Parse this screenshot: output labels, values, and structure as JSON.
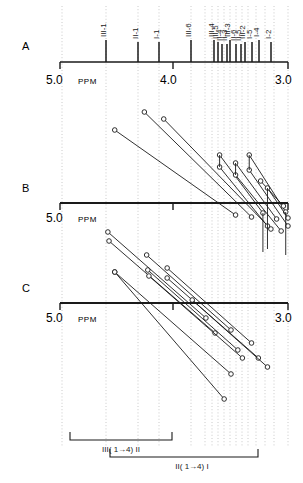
{
  "figure": {
    "type": "nmr-spectrum-correlation-figure",
    "background": "#ffffff",
    "line_color": "#1a1a1a",
    "grid_color": "#bdbdbd",
    "width": 303,
    "height": 483
  },
  "panels": [
    {
      "id": "A",
      "label": "A",
      "label_x": 22,
      "label_y": 46,
      "axis_y": 62
    },
    {
      "id": "B",
      "label": "B",
      "label_x": 22,
      "label_y": 188,
      "axis_y": 203
    },
    {
      "id": "C",
      "label": "C",
      "label_x": 22,
      "label_y": 288,
      "axis_y": 303
    }
  ],
  "axis": {
    "ppm_unit": "PPM",
    "left_label": "5.0",
    "mid_label": "4.0",
    "right_label": "3.0",
    "left_ppm": 5.0,
    "mid_ppm": 4.0,
    "right_ppm": 3.0,
    "x_left_px": 60,
    "x_right_px": 288,
    "ticks_ppm": [
      5.0,
      4.6,
      4.2,
      4.0,
      3.8,
      3.4,
      3.0
    ],
    "tick_label_y_offsets": [
      78,
      78,
      78
    ],
    "label_positions": {
      "left_x": 60,
      "mid_x": 173,
      "right_x": 288
    }
  },
  "chart_data": {
    "type": "scatter",
    "title": "",
    "xlabel": "PPM",
    "ylabel": "",
    "xlim": [
      5.0,
      3.0
    ],
    "grid": true,
    "legend": null,
    "panelA": {
      "description": "1D stick spectrum with assignment labels rotated 90 degrees",
      "peaks": [
        {
          "ppm": 4.52,
          "x_px": 106,
          "label": "III-1",
          "height": 22
        },
        {
          "ppm": 4.24,
          "x_px": 138,
          "label": "II-1",
          "height": 20
        },
        {
          "ppm": 4.06,
          "x_px": 159,
          "label": "I-1",
          "height": 20
        },
        {
          "ppm": 3.78,
          "x_px": 191,
          "label": "III-6",
          "height": 22
        },
        {
          "ppm": 3.58,
          "x_px": 214,
          "label": "III-4",
          "height": 22
        },
        {
          "ppm": 3.55,
          "x_px": 218,
          "label": "III-5",
          "height": 20
        },
        {
          "ppm": 3.52,
          "x_px": 222,
          "label": "II-4",
          "height": 18
        },
        {
          "ppm": 3.48,
          "x_px": 227,
          "label": "II-3",
          "height": 18
        },
        {
          "ppm": 3.45,
          "x_px": 230,
          "label": "III-3",
          "height": 22
        },
        {
          "ppm": 3.4,
          "x_px": 236,
          "label": "II-6",
          "height": 18
        },
        {
          "ppm": 3.36,
          "x_px": 241,
          "label": "II-5",
          "height": 18
        },
        {
          "ppm": 3.32,
          "x_px": 245,
          "label": "III-2",
          "height": 20
        },
        {
          "ppm": 3.26,
          "x_px": 252,
          "label": "I-5",
          "height": 20
        },
        {
          "ppm": 3.2,
          "x_px": 259,
          "label": "I-4",
          "height": 22
        },
        {
          "ppm": 3.1,
          "x_px": 271,
          "label": "I-2",
          "height": 20
        }
      ]
    },
    "panelB": {
      "description": "NOE / correlation connectivity traces, markers are open circles joined by diagonal lines",
      "series": [
        {
          "name": "b1",
          "points": [
            [
              4.52,
              130
            ],
            [
              3.46,
              215
            ]
          ]
        },
        {
          "name": "b2",
          "points": [
            [
              4.26,
              112
            ],
            [
              3.32,
              217
            ]
          ]
        },
        {
          "name": "b3",
          "points": [
            [
              4.09,
              119
            ],
            [
              3.15,
              229
            ]
          ]
        },
        {
          "name": "b4",
          "points": [
            [
              3.6,
              155
            ],
            [
              3.22,
              213
            ]
          ]
        },
        {
          "name": "b5",
          "points": [
            [
              3.6,
              167
            ],
            [
              3.18,
              226
            ]
          ]
        },
        {
          "name": "b6",
          "points": [
            [
              3.46,
              163
            ],
            [
              3.1,
              219
            ]
          ]
        },
        {
          "name": "b7",
          "points": [
            [
              3.46,
              175
            ],
            [
              3.06,
              231
            ]
          ]
        },
        {
          "name": "b8",
          "points": [
            [
              3.34,
              155
            ],
            [
              3.02,
              212
            ]
          ]
        },
        {
          "name": "b9",
          "points": [
            [
              3.34,
              170
            ],
            [
              3.0,
              226
            ]
          ]
        },
        {
          "name": "b10",
          "points": [
            [
              3.24,
              181
            ],
            [
              3.04,
              206
            ]
          ]
        },
        {
          "name": "b11",
          "points": [
            [
              3.18,
              188
            ],
            [
              3.0,
              218
            ]
          ]
        }
      ],
      "vertical_links": [
        {
          "x_ppm": 3.6,
          "y1": 155,
          "y2": 167
        },
        {
          "x_ppm": 3.46,
          "y1": 163,
          "y2": 175
        },
        {
          "x_ppm": 3.34,
          "y1": 155,
          "y2": 170
        },
        {
          "x_ppm": 3.22,
          "y1": 213,
          "y2": 252
        },
        {
          "x_ppm": 3.18,
          "y1": 188,
          "y2": 249
        },
        {
          "x_ppm": 3.02,
          "y1": 212,
          "y2": 255
        }
      ]
    },
    "panelC": {
      "description": "Second correlation panel, longer diagonal traces crossing the baseline",
      "series": [
        {
          "name": "c1",
          "points": [
            [
              4.58,
              232
            ],
            [
              3.72,
              318
            ]
          ]
        },
        {
          "name": "c2",
          "points": [
            [
              4.57,
              241
            ],
            [
              3.64,
              333
            ]
          ]
        },
        {
          "name": "c3",
          "points": [
            [
              4.52,
              272
            ],
            [
              3.5,
              374
            ]
          ]
        },
        {
          "name": "c4",
          "points": [
            [
              4.24,
              255
            ],
            [
              3.5,
              330
            ]
          ]
        },
        {
          "name": "c5",
          "points": [
            [
              4.23,
              270
            ],
            [
              3.44,
              350
            ]
          ]
        },
        {
          "name": "c6",
          "points": [
            [
              4.22,
              276
            ],
            [
              3.4,
              358
            ]
          ]
        },
        {
          "name": "c7",
          "points": [
            [
              4.06,
              268
            ],
            [
              3.32,
              343
            ]
          ]
        },
        {
          "name": "c8",
          "points": [
            [
              4.06,
              278
            ],
            [
              3.26,
              358
            ]
          ]
        },
        {
          "name": "c9",
          "points": [
            [
              3.84,
              300
            ],
            [
              3.18,
              367
            ]
          ]
        },
        {
          "name": "c10",
          "points": [
            [
              4.52,
              272
            ],
            [
              3.56,
              399
            ]
          ]
        }
      ]
    }
  },
  "brackets": [
    {
      "id": "bracket-iii-4-ii",
      "label": "III( 1→4) II",
      "x_start_px": 70,
      "x_end_px": 172,
      "y_px": 440,
      "label_x": 121,
      "label_y": 452
    },
    {
      "id": "bracket-ii-4-i",
      "label": "II( 1→4) I",
      "x_start_px": 110,
      "x_end_px": 258,
      "y_px": 457,
      "label_x": 192,
      "label_y": 469
    }
  ],
  "gridlines_px": [
    62,
    106,
    138,
    159,
    191,
    205,
    212,
    218,
    224,
    230,
    236,
    242,
    248,
    256,
    265,
    274,
    288
  ]
}
